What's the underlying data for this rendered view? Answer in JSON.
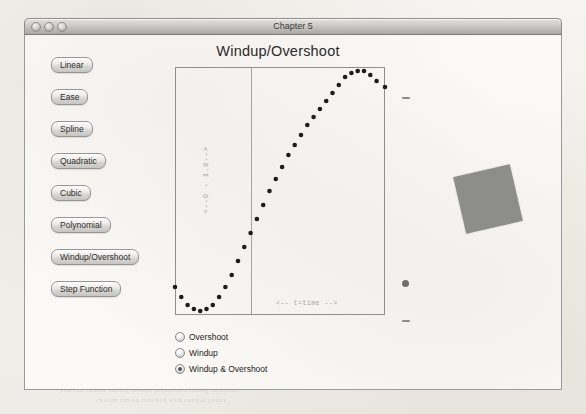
{
  "window": {
    "title": "Chapter 5",
    "traffic_lights": [
      "close",
      "minimize",
      "zoom"
    ]
  },
  "sidebar": {
    "buttons": [
      {
        "label": "Linear"
      },
      {
        "label": "Ease"
      },
      {
        "label": "Spline"
      },
      {
        "label": "Quadratic"
      },
      {
        "label": "Cubic"
      },
      {
        "label": "Polynomial"
      },
      {
        "label": "Windup/Overshoot"
      },
      {
        "label": "Step Function"
      }
    ]
  },
  "plot": {
    "title": "Windup/Overshoot",
    "y_axis_label": "<--0 - 1.0-->",
    "x_axis_label": "<-- t=time -->"
  },
  "radios": {
    "options": [
      {
        "label": "Overshoot",
        "selected": false
      },
      {
        "label": "Windup",
        "selected": false
      },
      {
        "label": "Windup & Overshoot",
        "selected": true
      }
    ]
  },
  "colors": {
    "curve": "#1d1d1d",
    "plot_border": "#8f8f8f",
    "object_fill": "#8d8d8a",
    "titlebar_text": "#3b3b3b"
  },
  "chart_data": {
    "type": "line",
    "title": "Windup/Overshoot",
    "xlabel": "<-- t=time -->",
    "ylabel": "<--0 - 1.0-->",
    "xlim": [
      0,
      1
    ],
    "ylim": [
      -0.12,
      1.12
    ],
    "grid": false,
    "legend": "none",
    "marker": "dotted",
    "series": [
      {
        "name": "Windup & Overshoot",
        "x": [
          0.0,
          0.03,
          0.06,
          0.09,
          0.12,
          0.15,
          0.18,
          0.21,
          0.24,
          0.27,
          0.3,
          0.33,
          0.36,
          0.39,
          0.42,
          0.45,
          0.48,
          0.51,
          0.54,
          0.57,
          0.6,
          0.63,
          0.66,
          0.69,
          0.72,
          0.75,
          0.78,
          0.81,
          0.84,
          0.87,
          0.9,
          0.93,
          0.96,
          1.0
        ],
        "y": [
          0.02,
          -0.03,
          -0.07,
          -0.09,
          -0.1,
          -0.09,
          -0.07,
          -0.03,
          0.02,
          0.08,
          0.15,
          0.22,
          0.29,
          0.36,
          0.43,
          0.5,
          0.56,
          0.62,
          0.68,
          0.73,
          0.78,
          0.83,
          0.87,
          0.91,
          0.95,
          0.99,
          1.03,
          1.07,
          1.09,
          1.1,
          1.1,
          1.08,
          1.05,
          1.02
        ]
      }
    ]
  },
  "background_bleed": [
    {
      "text": "screen when you set the value and the object is already animating",
      "x": 60,
      "y": 346,
      "w": 330
    },
    {
      "text": "will travel from its current position to the new one smoothly",
      "x": 70,
      "y": 356,
      "w": 320
    },
    {
      "text": "interpolation between the start and end values of the property",
      "x": 56,
      "y": 366,
      "w": 340
    },
    {
      "text": "curve that defines how the value changes over the duration",
      "x": 64,
      "y": 376,
      "w": 320
    },
    {
      "text": "you can choose among several predefined timing functions",
      "x": 60,
      "y": 386,
      "w": 330
    },
    {
      "text": "custom timing function with control points",
      "x": 96,
      "y": 396,
      "w": 240
    },
    {
      "text": "animation framework",
      "x": 408,
      "y": 70,
      "w": 120
    },
    {
      "text": "the value changes",
      "x": 414,
      "y": 82,
      "w": 110
    },
    {
      "text": "timing curves",
      "x": 402,
      "y": 104,
      "w": 90
    },
    {
      "text": "for the layer",
      "x": 410,
      "y": 116,
      "w": 80
    },
    {
      "text": "overshoot",
      "x": 420,
      "y": 186,
      "w": 70
    },
    {
      "text": "the object",
      "x": 412,
      "y": 198,
      "w": 70
    }
  ]
}
